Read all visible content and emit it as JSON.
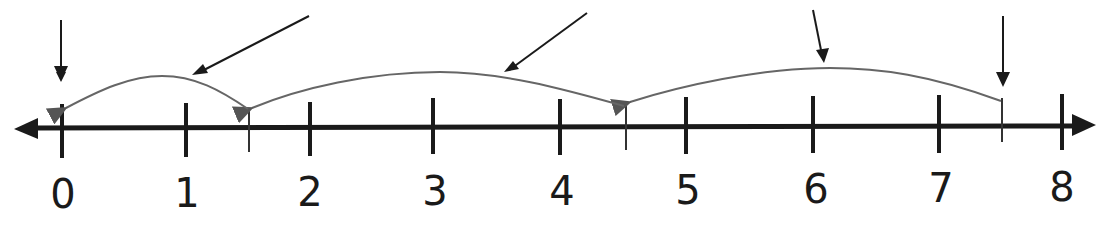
{
  "diagram": {
    "type": "number-line",
    "axis": {
      "min": 0,
      "max": 8,
      "y": 128,
      "x_start": 15,
      "x_end": 1095,
      "color": "#1a1a1a"
    },
    "ticks": [
      {
        "value": 0,
        "x": 62,
        "label": "0"
      },
      {
        "value": 1,
        "x": 186,
        "label": "1"
      },
      {
        "value": 2,
        "x": 310,
        "label": "2"
      },
      {
        "value": 3,
        "x": 433,
        "label": "3"
      },
      {
        "value": 4,
        "x": 560,
        "label": "4"
      },
      {
        "value": 5,
        "x": 686,
        "label": "5"
      },
      {
        "value": 6,
        "x": 813,
        "label": "6"
      },
      {
        "value": 7,
        "x": 939,
        "label": "7"
      },
      {
        "value": 8,
        "x": 1062,
        "label": "8"
      }
    ],
    "half_ticks": [
      {
        "value": 1.5,
        "x": 249
      },
      {
        "value": 4.5,
        "x": 626
      },
      {
        "value": 7.5,
        "x": 1002
      }
    ],
    "jumps": [
      {
        "from": 7.5,
        "to": 4.5,
        "color": "#666666"
      },
      {
        "from": 4.5,
        "to": 1.5,
        "color": "#666666"
      },
      {
        "from": 1.5,
        "to": 0,
        "color": "#666666"
      }
    ],
    "pointer_arrows": [
      {
        "target": "start-0",
        "desc": "vertical arrow pointing at 0"
      },
      {
        "target": "jump-1.5-to-0",
        "desc": "diagonal arrow pointing at first arc"
      },
      {
        "target": "jump-4.5-to-1.5",
        "desc": "diagonal arrow pointing at middle arc"
      },
      {
        "target": "jump-7.5-to-4.5",
        "desc": "diagonal arrow pointing at right arc"
      },
      {
        "target": "start-7.5",
        "desc": "vertical arrow pointing at 7.5"
      }
    ]
  }
}
